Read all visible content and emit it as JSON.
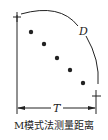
{
  "diagram": {
    "label_d": "D",
    "label_t": "T",
    "caption": "M模式法测量距离",
    "dots": [
      [
        31,
        32
      ],
      [
        44,
        44
      ],
      [
        57,
        58
      ],
      [
        70,
        70
      ],
      [
        83,
        83
      ]
    ],
    "color": "#222222"
  }
}
